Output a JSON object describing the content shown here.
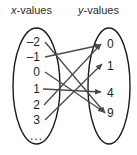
{
  "headers": {
    "left": {
      "var": "x",
      "suffix": "-values"
    },
    "right": {
      "var": "y",
      "suffix": "-values"
    }
  },
  "domain": {
    "name": "x-values",
    "items": [
      {
        "label": "–2",
        "value": -2,
        "y": 42
      },
      {
        "label": "–1",
        "value": -1,
        "y": 57
      },
      {
        "label": "0",
        "value": 0,
        "y": 72
      },
      {
        "label": "1",
        "value": 1,
        "y": 89
      },
      {
        "label": "2",
        "value": 2,
        "y": 105
      },
      {
        "label": "3",
        "value": 3,
        "y": 120
      }
    ],
    "ellipsis": "...",
    "ellipsis_y": 136
  },
  "range": {
    "name": "y-values",
    "items": [
      {
        "label": "0",
        "value": 0,
        "y": 44
      },
      {
        "label": "1",
        "value": 1,
        "y": 66
      },
      {
        "label": "4",
        "value": 4,
        "y": 93
      },
      {
        "label": "9",
        "value": 9,
        "y": 113
      }
    ]
  },
  "mappings": [
    {
      "from": "–2",
      "to": "9",
      "x1": 45,
      "y1": 42,
      "x2": 105,
      "y2": 113
    },
    {
      "from": "–1",
      "to": "0",
      "x1": 45,
      "y1": 57,
      "x2": 101,
      "y2": 45
    },
    {
      "from": "0",
      "to": "9",
      "x1": 45,
      "y1": 72,
      "x2": 104,
      "y2": 112
    },
    {
      "from": "1",
      "to": "4",
      "x1": 43,
      "y1": 89,
      "x2": 101,
      "y2": 92
    },
    {
      "from": "2",
      "to": "0",
      "x1": 44,
      "y1": 105,
      "x2": 101,
      "y2": 44
    },
    {
      "from": "3",
      "to": "1",
      "x1": 45,
      "y1": 120,
      "x2": 102,
      "y2": 64
    }
  ],
  "style": {
    "line_color": "#4a4a4a",
    "ellipse_color": "#1a1a1a",
    "text_color": "#1f1f1f",
    "background": "#ffffff"
  },
  "ellipses": {
    "left": {
      "cx": 36.5,
      "cy": 86,
      "rx": 23.5,
      "ry": 58
    },
    "right": {
      "cx": 109,
      "cy": 86,
      "rx": 21,
      "ry": 58
    }
  }
}
